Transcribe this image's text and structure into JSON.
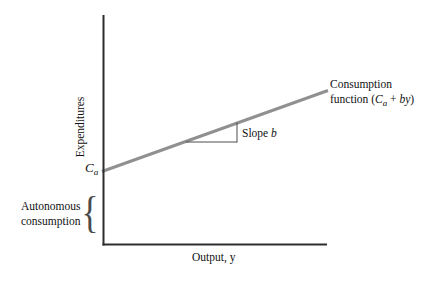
{
  "figure": {
    "y_axis_label": "Expenditures",
    "x_axis_label": "Output, y",
    "intercept": {
      "symbol": "C",
      "subscript": "a"
    },
    "autonomous_label": {
      "line1": "Autonomous",
      "line2": "consumption"
    },
    "slope_annotation": {
      "prefix": "Slope ",
      "variable": "b"
    },
    "curve_label": {
      "line1": "Consumption",
      "line2_prefix": "function (",
      "symbol": "C",
      "subscript": "a",
      "operator": " + ",
      "slope_term": "by",
      "suffix": ")"
    },
    "brace_glyph": "{"
  },
  "chart": {
    "type": "line",
    "intercept": "Ca",
    "slope": "b"
  },
  "colors": {
    "axis": "#2d2d2d",
    "curve": "#909090",
    "triangle": "#4d4d4d",
    "text": "#111111",
    "background": "#ffffff"
  }
}
